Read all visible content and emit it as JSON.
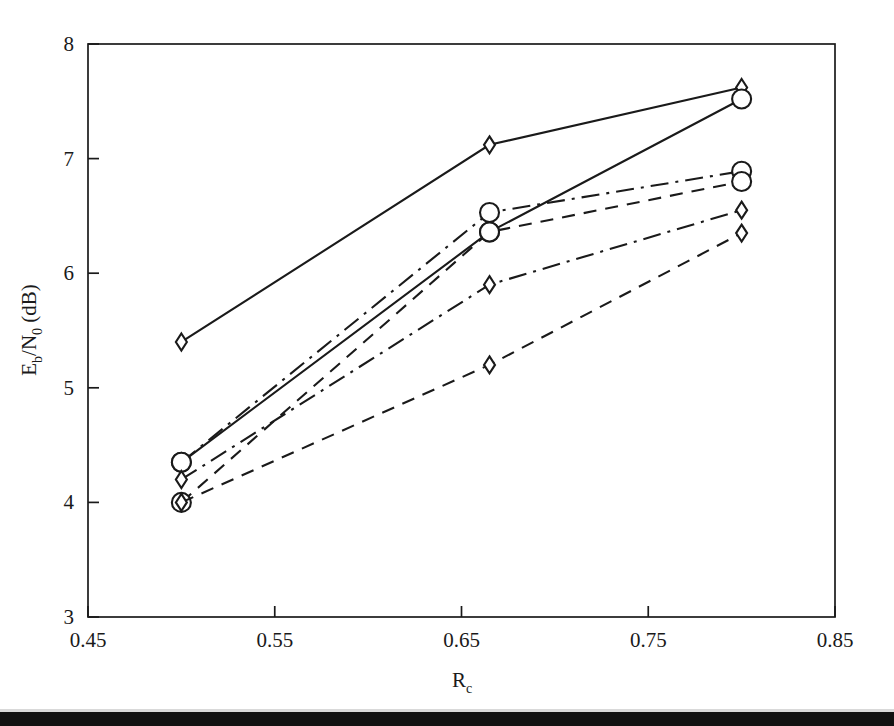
{
  "figure": {
    "background_color": "#ffffff",
    "ink_color": "#1a1a1a",
    "scan_bar_color": "#111111"
  },
  "chart_data": {
    "type": "line",
    "title": "",
    "subtitle": "",
    "xlabel": "R_c",
    "xlabel_base": "R",
    "xlabel_sub": "c",
    "ylabel": "E_b/N_0 (dB)",
    "ylabel_parts": {
      "e": "E",
      "b": "b",
      "slash": "/N",
      "zero": "0",
      "units": " (dB)"
    },
    "xlim": [
      0.45,
      0.85
    ],
    "ylim": [
      3,
      8
    ],
    "xticks": [
      0.45,
      0.55,
      0.65,
      0.75,
      0.85
    ],
    "xtick_labels": [
      "0.45",
      "0.55",
      "0.65",
      "0.75",
      "0.85"
    ],
    "yticks": [
      3,
      4,
      5,
      6,
      7,
      8
    ],
    "ytick_labels": [
      "3",
      "4",
      "5",
      "6",
      "7",
      "8"
    ],
    "grid": false,
    "legend": "none",
    "frame": "full-box",
    "x": [
      0.5,
      0.665,
      0.8
    ],
    "series": [
      {
        "name": "series-1",
        "marker": "diamond",
        "linestyle": "solid",
        "values": [
          5.4,
          7.12,
          7.62
        ]
      },
      {
        "name": "series-2",
        "marker": "circle",
        "linestyle": "solid",
        "values": [
          4.35,
          6.36,
          7.52
        ]
      },
      {
        "name": "series-3",
        "marker": "circle",
        "linestyle": "dash-dot",
        "values": [
          4.35,
          6.53,
          6.89
        ]
      },
      {
        "name": "series-4",
        "marker": "circle",
        "linestyle": "dashed",
        "values": [
          4.0,
          6.36,
          6.8
        ]
      },
      {
        "name": "series-5",
        "marker": "diamond",
        "linestyle": "dash-dot",
        "values": [
          4.2,
          5.9,
          6.55
        ]
      },
      {
        "name": "series-6",
        "marker": "diamond",
        "linestyle": "dashed",
        "values": [
          4.0,
          5.2,
          6.35
        ]
      }
    ]
  }
}
